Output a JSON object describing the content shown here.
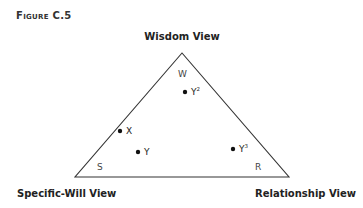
{
  "figure_label": "Figure C.5",
  "vertices": {
    "top": {
      "label": "Wisdom View",
      "corner": "W"
    },
    "left": {
      "label": "Specific-Will View",
      "corner": "S"
    },
    "right": {
      "label": "Relationship View",
      "corner": "R"
    }
  },
  "points": [
    {
      "id": "Y2",
      "base": "Y",
      "sup": "2"
    },
    {
      "id": "X",
      "base": "X",
      "sup": ""
    },
    {
      "id": "Y",
      "base": "Y",
      "sup": ""
    },
    {
      "id": "Y3",
      "base": "Y",
      "sup": "3"
    }
  ],
  "colors": {
    "line": "#333333",
    "point": "#111111"
  }
}
